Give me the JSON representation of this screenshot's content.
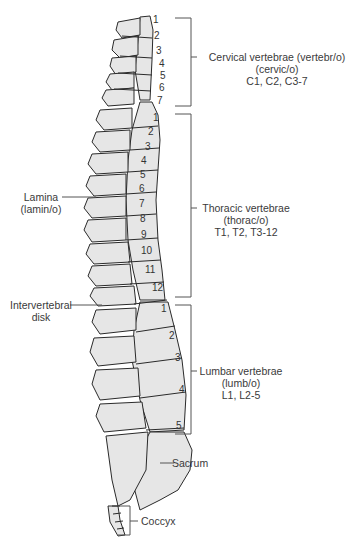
{
  "diagram": {
    "colors": {
      "bone_fill": "#e6e6e6",
      "outline": "#2a2a2a",
      "bracket": "#555555",
      "text": "#3a3a3a"
    },
    "regions": [
      {
        "key": "cervical",
        "line1": "Cervical vertebrae (vertebr/o)",
        "line2": "(cervic/o)",
        "line3": "C1, C2, C3-7",
        "numbers": [
          "1",
          "2",
          "3",
          "4",
          "5",
          "6",
          "7"
        ]
      },
      {
        "key": "thoracic",
        "line1": "Thoracic vertebrae",
        "line2": "(thorac/o)",
        "line3": "T1, T2, T3-12",
        "numbers": [
          "1",
          "2",
          "3",
          "4",
          "5",
          "6",
          "7",
          "8",
          "9",
          "10",
          "11",
          "12"
        ]
      },
      {
        "key": "lumbar",
        "line1": "Lumbar vertebrae",
        "line2": "(lumb/o)",
        "line3": "L1, L2-5",
        "numbers": [
          "1",
          "2",
          "3",
          "4",
          "5"
        ]
      }
    ],
    "left_labels": [
      {
        "line1": "Lamina",
        "line2": "(lamin/o)"
      },
      {
        "line1": "Intervertebral",
        "line2": "disk"
      }
    ],
    "bottom_labels": {
      "sacrum": "Sacrum",
      "coccyx": "Coccyx"
    }
  }
}
